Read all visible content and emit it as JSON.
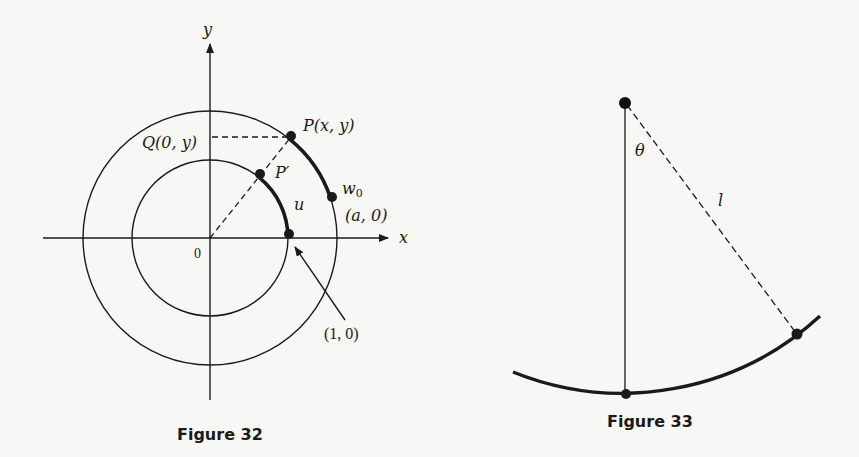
{
  "figures": [
    {
      "caption": "Figure 32",
      "labels": {
        "y_axis": "y",
        "x_axis": "x",
        "origin": "0",
        "point_P": "P(x, y)",
        "point_Q": "Q(0, y)",
        "point_P_prime": "P′",
        "point_w0_w": "w",
        "point_w0_sub": "0",
        "point_a0": "(a, 0)",
        "arc_u": "u",
        "point_10": "(1, 0)"
      }
    },
    {
      "caption": "Figure 33",
      "labels": {
        "angle": "θ",
        "length": "l"
      }
    }
  ],
  "colors": {
    "ink": "#1a1a1a",
    "background": "#f7f7f5"
  }
}
